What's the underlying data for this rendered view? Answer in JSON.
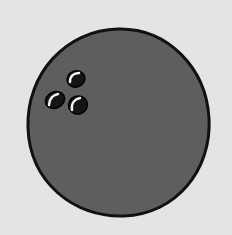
{
  "illustration": {
    "subject": "bowling ball",
    "colors": {
      "background": "#e4e4e4",
      "ball_fill": "#5e5e5e",
      "outline": "#111111",
      "hole_fill": "#151515",
      "highlight": "#f2f2f2"
    },
    "finger_holes": 3
  }
}
